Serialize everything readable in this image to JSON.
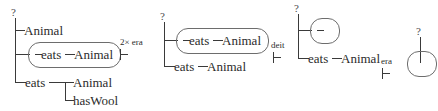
{
  "figure": {
    "type": "derivation-sequence",
    "background_color": "#ffffff",
    "stroke_color": "#3a3a3a",
    "box_stroke_color": "#6d6d6d",
    "text_color": "#2b2b2b"
  },
  "trees": [
    {
      "id": "tree-1",
      "root_label": "?",
      "branches": [
        {
          "id": "t1-b1",
          "label": "Animal",
          "boxed": false
        },
        {
          "id": "t1-b2",
          "label": "eats",
          "child_label": "Animal",
          "boxed": true
        },
        {
          "id": "t1-b3",
          "label": "eats",
          "boxed": false,
          "children": [
            {
              "id": "t1-b3-c1",
              "label": "Animal"
            },
            {
              "id": "t1-b3-c2",
              "label": "hasWool"
            }
          ]
        }
      ]
    },
    {
      "id": "tree-2",
      "root_label": "?",
      "branches": [
        {
          "id": "t2-b1",
          "label": "eats",
          "child_label": "Animal",
          "boxed": true
        },
        {
          "id": "t2-b2",
          "label": "eats",
          "child_label": "Animal",
          "boxed": false
        }
      ]
    },
    {
      "id": "tree-3",
      "root_label": "?",
      "branches": [
        {
          "id": "t3-b1",
          "label": "",
          "boxed": true
        },
        {
          "id": "t3-b2",
          "label": "eats",
          "child_label": "Animal",
          "boxed": false
        }
      ]
    },
    {
      "id": "tree-4",
      "root_label": "?",
      "branches": [
        {
          "id": "t4-b1",
          "label": "",
          "boxed": true
        }
      ]
    }
  ],
  "operators": [
    {
      "id": "op-1",
      "label": "2× era",
      "symbol": "⊢"
    },
    {
      "id": "op-2",
      "label": "deit",
      "symbol": "⊢"
    },
    {
      "id": "op-3",
      "label": "era",
      "symbol": "⊢"
    }
  ]
}
